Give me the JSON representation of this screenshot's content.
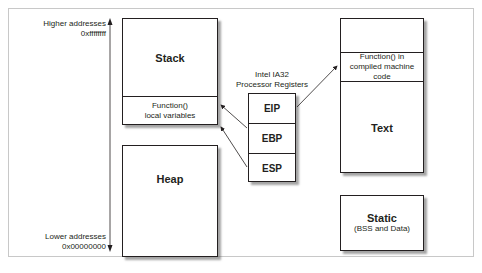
{
  "diagram": {
    "address_axis": {
      "top_label_line1": "Higher addresses",
      "top_label_line2": "0xffffffff",
      "bottom_label_line1": "Lower addresses",
      "bottom_label_line2": "0x00000000"
    },
    "stack": {
      "title": "Stack",
      "frame_line1": "Function()",
      "frame_line2": "local variables"
    },
    "heap": {
      "title": "Heap"
    },
    "registers": {
      "caption_line1": "Intel IA32",
      "caption_line2": "Processor Registers",
      "items": [
        {
          "name": "EIP"
        },
        {
          "name": "EBP"
        },
        {
          "name": "ESP"
        }
      ]
    },
    "text_segment": {
      "title": "Text",
      "function_line1": "Function() in",
      "function_line2": "compiled machine code"
    },
    "static_segment": {
      "title": "Static",
      "subtitle": "(BSS and Data)"
    },
    "colors": {
      "line": "#231f20",
      "frame": "#c8c8c8",
      "shadow": "#5a5a5a"
    }
  }
}
